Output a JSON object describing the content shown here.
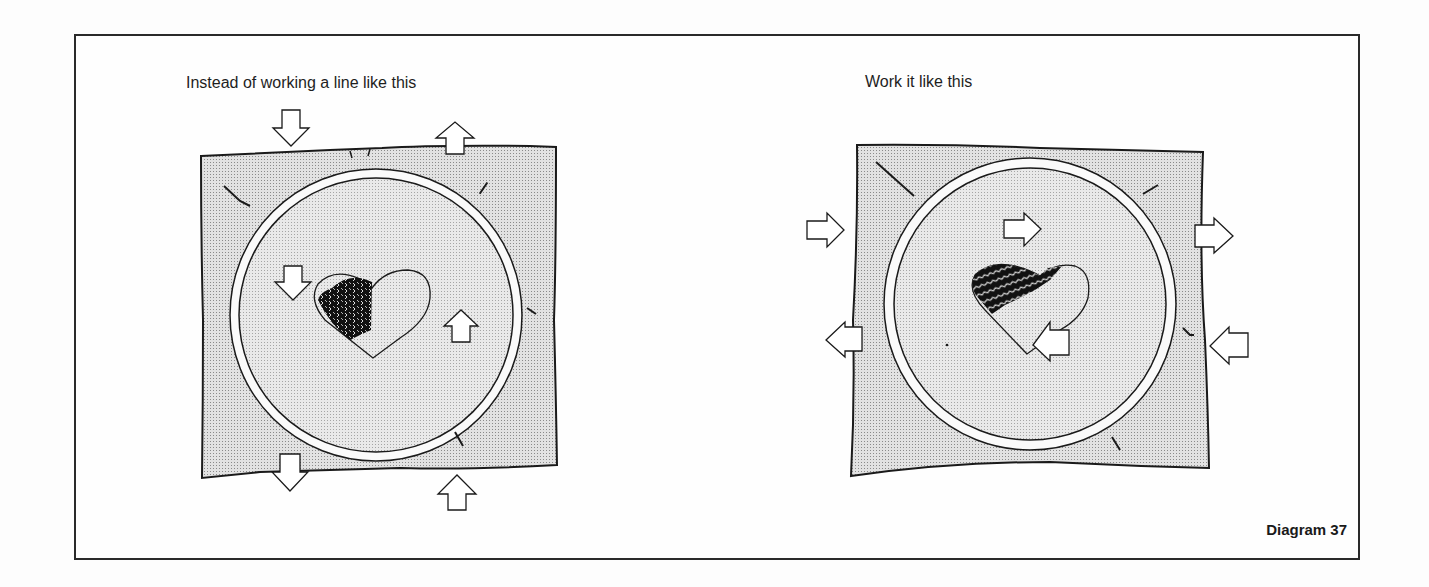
{
  "figure": {
    "label": "Diagram 37",
    "panels": [
      {
        "id": "wrong",
        "caption": "Instead of working a line like this",
        "description": "Embroidery hoop on fabric; heart partially filled with vertical rows of stitches; arrows indicate fabric pulled up and down (vertical tension)",
        "arrows": [
          "down (top-left, outside)",
          "up (top-right, outside)",
          "down (inside, left of heart)",
          "up (inside, right of heart)",
          "down (bottom-left, outside)",
          "up (bottom-right, outside)"
        ]
      },
      {
        "id": "right",
        "caption": "Work it like this",
        "description": "Embroidery hoop on fabric; heart partially filled with diagonal zig-zag rows of stitches; arrows indicate fabric pulled left and right (horizontal tension)",
        "arrows": [
          "right (left upper, outside)",
          "left (left lower, outside)",
          "right (inside, above heart)",
          "left (inside, below-right of heart)",
          "right (right upper, outside)",
          "left (right lower, outside)"
        ]
      }
    ]
  },
  "colors": {
    "ink": "#1a1a1a",
    "fabric": "#d9d9d9",
    "hoop_inner": "#e4e4e4",
    "paper": "#fdfdfd"
  }
}
